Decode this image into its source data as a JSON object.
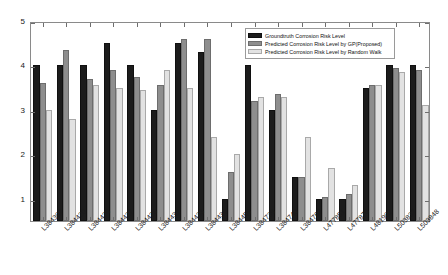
{
  "chart_data": {
    "type": "bar",
    "title": "",
    "xlabel": "",
    "ylabel": "",
    "ylim": [
      0.5,
      5
    ],
    "yticks": [
      1,
      2,
      3,
      4,
      5
    ],
    "grid": false,
    "legend_position": "upper right",
    "categories": [
      "L384307",
      "L384420",
      "L384426",
      "L384427",
      "L384428",
      "L384432",
      "L384433",
      "L384436",
      "L384459",
      "L384739",
      "L384740",
      "L384767",
      "L477851",
      "L477876",
      "L481902",
      "L503837",
      "L503848"
    ],
    "series": [
      {
        "name": "Groundtruth Corrosion Risk Level",
        "color": "#1c1c1c",
        "values": [
          4.0,
          4.0,
          4.0,
          4.5,
          4.0,
          3.0,
          4.5,
          4.3,
          1.0,
          4.0,
          3.0,
          1.5,
          1.0,
          1.0,
          3.5,
          4.0,
          4.0
        ]
      },
      {
        "name": "Predicted Corrosion Risk Level by GP(Proposed)",
        "color": "#8e8e8e",
        "values": [
          3.6,
          4.35,
          3.7,
          3.9,
          3.75,
          3.55,
          4.6,
          4.6,
          1.6,
          3.2,
          3.35,
          1.5,
          1.05,
          1.1,
          3.55,
          3.95,
          3.9
        ]
      },
      {
        "name": "Predicted Corrosion Risk Level by Random Walk",
        "color": "#e2e2e2",
        "values": [
          3.0,
          2.8,
          3.55,
          3.5,
          3.45,
          3.9,
          3.5,
          2.4,
          2.0,
          3.3,
          3.3,
          2.4,
          1.7,
          1.3,
          3.55,
          3.85,
          3.1
        ]
      }
    ]
  },
  "legend": {
    "items": [
      "Groundtruth Corrosion Risk Level",
      "Predicted Corrosion Risk Level by GP(Proposed)",
      "Predicted Corrosion Risk Level by Random Walk"
    ]
  }
}
